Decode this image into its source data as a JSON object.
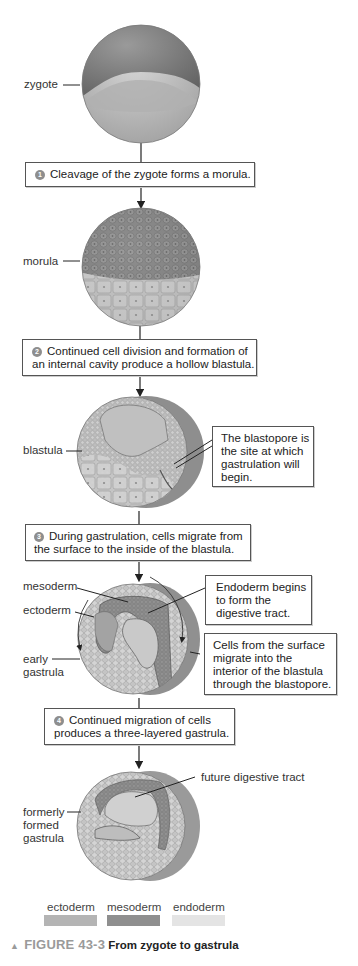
{
  "figure": {
    "number": "FIGURE 43-3",
    "title": "From zygote to gastrula",
    "marker": "▲"
  },
  "stages": [
    {
      "id": "zygote",
      "label": "zygote"
    },
    {
      "id": "morula",
      "label": "morula"
    },
    {
      "id": "blastula",
      "label": "blastula"
    },
    {
      "id": "early-gastrula",
      "label": "early\ngastrula",
      "label_lines": [
        "early",
        "gastrula"
      ]
    },
    {
      "id": "formerly-formed-gastrula",
      "label_lines": [
        "formerly",
        "formed",
        "gastrula"
      ]
    }
  ],
  "steps": [
    {
      "number": "1",
      "lines": [
        "Cleavage of the zygote forms a morula."
      ]
    },
    {
      "number": "2",
      "lines": [
        "Continued cell division and formation of",
        "an internal cavity produce a hollow blastula."
      ]
    },
    {
      "number": "3",
      "lines": [
        "During gastrulation, cells migrate from",
        "the surface to the inside of the blastula."
      ]
    },
    {
      "number": "4",
      "lines": [
        "Continued migration of cells",
        "produces a three-layered gastrula."
      ]
    }
  ],
  "callouts": {
    "blastopore": [
      "The blastopore is",
      "the site at which",
      "gastrulation will",
      "begin."
    ],
    "endoderm": [
      "Endoderm begins",
      "to form the",
      "digestive tract."
    ],
    "migration": [
      "Cells from the surface",
      "migrate into the",
      "interior of the blastula",
      "through the blastopore."
    ]
  },
  "structure_labels": {
    "mesoderm": "mesoderm",
    "ectoderm": "ectoderm",
    "future_digestive_tract": "future digestive tract"
  },
  "legend": [
    {
      "name": "ectoderm",
      "color": "#b4b4b4"
    },
    {
      "name": "mesoderm",
      "color": "#8f8f8f"
    },
    {
      "name": "endoderm",
      "color": "#e4e4e4"
    }
  ],
  "colors": {
    "ectoderm": "#9a9a9a",
    "mesoderm": "#7f7f7f",
    "endoderm": "#d2d2d2",
    "line": "#222222"
  }
}
